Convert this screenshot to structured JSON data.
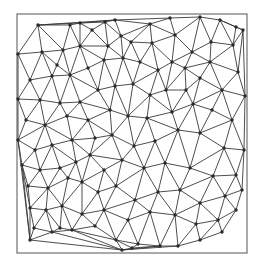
{
  "diagram": {
    "type": "delaunay-triangulation",
    "colors": {
      "frame": "#555555",
      "edge": "#3a3a3a",
      "vertex": "#2a2a2a",
      "background": "#ffffff"
    },
    "points": [
      [
        38,
        25
      ],
      [
        70,
        25
      ],
      [
        80,
        23
      ],
      [
        105,
        22
      ],
      [
        115,
        20
      ],
      [
        150,
        24
      ],
      [
        170,
        18
      ],
      [
        200,
        17
      ],
      [
        220,
        20
      ],
      [
        236,
        27
      ],
      [
        243,
        30
      ],
      [
        18,
        54
      ],
      [
        42,
        52
      ],
      [
        63,
        50
      ],
      [
        57,
        65
      ],
      [
        80,
        46
      ],
      [
        92,
        30
      ],
      [
        108,
        46
      ],
      [
        121,
        36
      ],
      [
        131,
        42
      ],
      [
        152,
        43
      ],
      [
        175,
        35
      ],
      [
        192,
        52
      ],
      [
        211,
        42
      ],
      [
        233,
        45
      ],
      [
        30,
        80
      ],
      [
        52,
        76
      ],
      [
        70,
        75
      ],
      [
        88,
        68
      ],
      [
        104,
        60
      ],
      [
        123,
        58
      ],
      [
        140,
        62
      ],
      [
        158,
        70
      ],
      [
        172,
        62
      ],
      [
        185,
        68
      ],
      [
        210,
        62
      ],
      [
        238,
        72
      ],
      [
        18,
        99
      ],
      [
        40,
        100
      ],
      [
        60,
        103
      ],
      [
        80,
        102
      ],
      [
        98,
        90
      ],
      [
        115,
        86
      ],
      [
        133,
        84
      ],
      [
        150,
        95
      ],
      [
        166,
        90
      ],
      [
        186,
        90
      ],
      [
        200,
        78
      ],
      [
        222,
        90
      ],
      [
        245,
        96
      ],
      [
        26,
        120
      ],
      [
        45,
        125
      ],
      [
        67,
        116
      ],
      [
        88,
        120
      ],
      [
        110,
        110
      ],
      [
        128,
        116
      ],
      [
        147,
        118
      ],
      [
        172,
        112
      ],
      [
        193,
        104
      ],
      [
        212,
        110
      ],
      [
        232,
        120
      ],
      [
        18,
        140
      ],
      [
        35,
        150
      ],
      [
        52,
        145
      ],
      [
        72,
        140
      ],
      [
        95,
        138
      ],
      [
        112,
        135
      ],
      [
        134,
        146
      ],
      [
        155,
        141
      ],
      [
        178,
        130
      ],
      [
        200,
        133
      ],
      [
        224,
        148
      ],
      [
        244,
        150
      ],
      [
        22,
        165
      ],
      [
        40,
        170
      ],
      [
        60,
        168
      ],
      [
        76,
        162
      ],
      [
        90,
        155
      ],
      [
        104,
        170
      ],
      [
        122,
        160
      ],
      [
        144,
        168
      ],
      [
        165,
        163
      ],
      [
        190,
        168
      ],
      [
        213,
        176
      ],
      [
        236,
        175
      ],
      [
        28,
        186
      ],
      [
        48,
        188
      ],
      [
        68,
        178
      ],
      [
        82,
        182
      ],
      [
        98,
        192
      ],
      [
        116,
        186
      ],
      [
        135,
        200
      ],
      [
        158,
        192
      ],
      [
        180,
        190
      ],
      [
        200,
        203
      ],
      [
        225,
        196
      ],
      [
        242,
        190
      ],
      [
        30,
        208
      ],
      [
        46,
        210
      ],
      [
        62,
        206
      ],
      [
        82,
        214
      ],
      [
        104,
        210
      ],
      [
        128,
        220
      ],
      [
        150,
        212
      ],
      [
        175,
        215
      ],
      [
        196,
        224
      ],
      [
        218,
        220
      ],
      [
        236,
        210
      ],
      [
        34,
        228
      ],
      [
        52,
        232
      ],
      [
        72,
        230
      ],
      [
        95,
        226
      ],
      [
        116,
        240
      ],
      [
        138,
        244
      ],
      [
        160,
        246
      ],
      [
        178,
        246
      ],
      [
        200,
        240
      ],
      [
        222,
        232
      ],
      [
        30,
        240
      ],
      [
        60,
        228
      ],
      [
        122,
        250
      ],
      [
        132,
        248
      ]
    ]
  }
}
